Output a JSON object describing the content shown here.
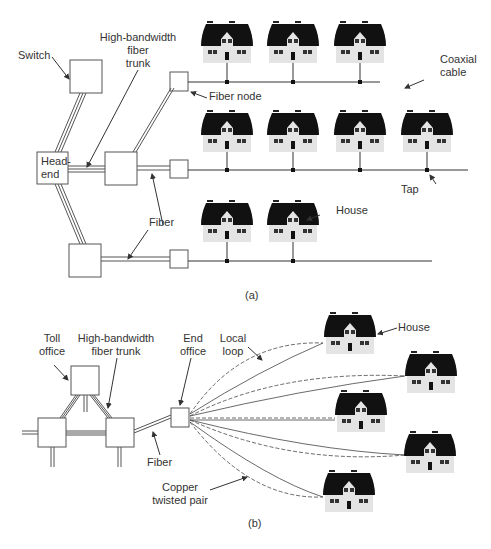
{
  "part_a": {
    "caption": "(a)",
    "labels": {
      "switch": "Switch",
      "trunk": [
        "High-bandwidth",
        "fiber",
        "trunk"
      ],
      "fiber_node": "Fiber node",
      "coaxial": [
        "Coaxial",
        "cable"
      ],
      "head_end": [
        "Head-",
        "end"
      ],
      "fiber": "Fiber",
      "tap": "Tap",
      "house": "House"
    }
  },
  "part_b": {
    "caption": "(b)",
    "labels": {
      "toll_office": [
        "Toll",
        "office"
      ],
      "trunk": [
        "High-bandwidth",
        "fiber trunk"
      ],
      "end_office": [
        "End",
        "office"
      ],
      "local_loop": [
        "Local",
        "loop"
      ],
      "house": "House",
      "fiber": "Fiber",
      "copper": [
        "Copper",
        "twisted pair"
      ]
    }
  },
  "colors": {
    "line": "#444444",
    "roof": "#111111",
    "wall": "#e6e6e6"
  }
}
